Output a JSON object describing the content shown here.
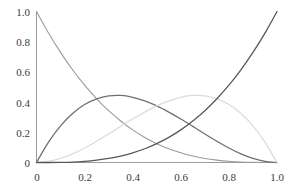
{
  "chart_data": {
    "type": "line",
    "title": "",
    "subtitle": "",
    "xlabel": "",
    "ylabel": "",
    "xlim": [
      0,
      1
    ],
    "ylim": [
      0,
      1
    ],
    "grid": false,
    "legend": "none",
    "xticks": [
      "0",
      "0.2",
      "0.4",
      "0.6",
      "0.8",
      "1.0"
    ],
    "xtick_values": [
      0,
      0.2,
      0.4,
      0.6,
      0.8,
      1.0
    ],
    "yticks": [
      "0",
      "0.2",
      "0.4",
      "0.6",
      "0.8",
      "1.0"
    ],
    "ytick_values": [
      0,
      0.2,
      0.4,
      0.6,
      0.8,
      1.0
    ],
    "x": [
      0,
      0.05,
      0.1,
      0.15,
      0.2,
      0.25,
      0.3,
      0.35,
      0.4,
      0.45,
      0.5,
      0.55,
      0.6,
      0.65,
      0.7,
      0.75,
      0.8,
      0.85,
      0.9,
      0.95,
      1.0
    ],
    "series": [
      {
        "name": "(1-x)^3",
        "color": "#9a9a9a",
        "width": 1.1,
        "values": [
          1.0,
          0.857,
          0.729,
          0.614,
          0.512,
          0.422,
          0.343,
          0.275,
          0.216,
          0.166,
          0.125,
          0.091,
          0.064,
          0.043,
          0.027,
          0.016,
          0.008,
          0.003,
          0.001,
          0.0,
          0.0
        ]
      },
      {
        "name": "3x(1-x)^2",
        "color": "#6f6f6f",
        "width": 1.3,
        "values": [
          0.0,
          0.135,
          0.243,
          0.325,
          0.384,
          0.422,
          0.441,
          0.444,
          0.432,
          0.408,
          0.375,
          0.334,
          0.288,
          0.239,
          0.189,
          0.141,
          0.096,
          0.057,
          0.027,
          0.007,
          0.0
        ]
      },
      {
        "name": "3x^2(1-x)",
        "color": "#dcdcdc",
        "width": 1.3,
        "values": [
          0.0,
          0.007,
          0.027,
          0.057,
          0.096,
          0.141,
          0.189,
          0.239,
          0.288,
          0.334,
          0.375,
          0.408,
          0.432,
          0.444,
          0.441,
          0.422,
          0.384,
          0.325,
          0.243,
          0.135,
          0.0
        ]
      },
      {
        "name": "x^3",
        "color": "#585858",
        "width": 1.3,
        "values": [
          0.0,
          0.0,
          0.001,
          0.003,
          0.008,
          0.016,
          0.027,
          0.043,
          0.064,
          0.091,
          0.125,
          0.166,
          0.216,
          0.275,
          0.343,
          0.422,
          0.512,
          0.614,
          0.729,
          0.857,
          1.0
        ]
      }
    ],
    "axes": {
      "spine_color": "#9c9c9c",
      "background": "#ffffff",
      "tick_text_color": "#3b3b3b"
    }
  }
}
